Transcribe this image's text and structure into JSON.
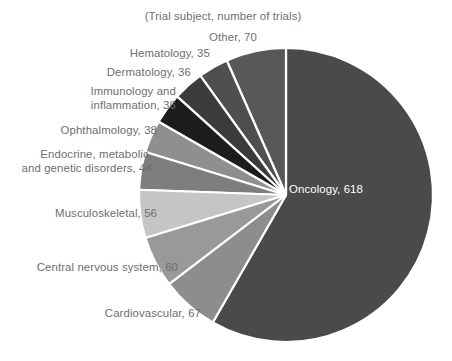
{
  "chart_data": {
    "type": "pie",
    "title": "",
    "subtitle": "(Trial subject, number of trials)",
    "xlabel": "",
    "ylabel": "",
    "legend_position": "none",
    "grid": false,
    "total": 1060,
    "start_angle_deg": 0,
    "direction": "clockwise",
    "categories": [
      "Oncology",
      "Cardiovascular",
      "Central nervous system",
      "Musculoskeletal",
      "Endocrine, metabolic, and genetic disorders",
      "Ophthalmology",
      "Immunology and inflammation",
      "Dermatology",
      "Hematology",
      "Other"
    ],
    "values": [
      618,
      67,
      60,
      56,
      44,
      38,
      36,
      36,
      35,
      70
    ],
    "slices": [
      {
        "name": "Oncology",
        "value": 618,
        "label": "Oncology, 618",
        "color": "#4a4a4a",
        "label_placement": "inside",
        "label_x": 326,
        "label_y": 190
      },
      {
        "name": "Cardiovascular",
        "value": 67,
        "label": "Cardiovascular, 67",
        "color": "#8d8d8d",
        "label_placement": "outside",
        "label_x": 200,
        "label_y": 312
      },
      {
        "name": "Central nervous system",
        "value": 60,
        "label": "Central nervous system, 60",
        "color": "#999999",
        "label_placement": "outside",
        "label_x": 177,
        "label_y": 266
      },
      {
        "name": "Musculoskeletal",
        "value": 56,
        "label": "Musculoskeletal, 56",
        "color": "#c5c5c5",
        "label_placement": "outside",
        "label_x": 156,
        "label_y": 212
      },
      {
        "name": "Endocrine, metabolic, and genetic disorders",
        "value": 44,
        "label_line1": "Endocrine, metabolic,",
        "label_line2": "and genetic disorders, 44",
        "color": "#7e7e7e",
        "label_placement": "outside",
        "label_x": 148,
        "label_y": 152
      },
      {
        "name": "Ophthalmology",
        "value": 38,
        "label": "Ophthalmology, 38",
        "color": "#8f8f8f",
        "label_placement": "outside",
        "label_x": 144,
        "label_y": 129
      },
      {
        "name": "Immunology and inflammation",
        "value": 36,
        "label_line1": "Immunology and",
        "label_line2": "inflammation, 36",
        "color": "#1c1c1c",
        "label_placement": "outside",
        "label_x": 165,
        "label_y": 92
      },
      {
        "name": "Dermatology",
        "value": 36,
        "label": "Dermatology, 36",
        "color": "#3b3b3b",
        "label_placement": "outside",
        "label_x": 181,
        "label_y": 71
      },
      {
        "name": "Hematology",
        "value": 35,
        "label": "Hematology, 35",
        "color": "#4f4f4f",
        "label_placement": "outside",
        "label_x": 200,
        "label_y": 51
      },
      {
        "name": "Other",
        "value": 70,
        "label": "Other, 70",
        "color": "#585858",
        "label_placement": "outside",
        "label_x": 233,
        "label_y": 35
      }
    ],
    "geometry": {
      "center_x": 286,
      "center_y": 195,
      "radius": 147,
      "separator_color": "#ffffff",
      "separator_width": 2.2
    },
    "colors": {
      "background": "#ffffff",
      "label_text": "#6e6e6e",
      "inside_label_text": "#ffffff"
    }
  }
}
